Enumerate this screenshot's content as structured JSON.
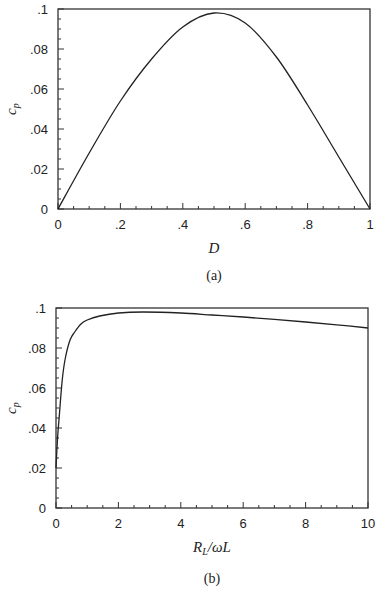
{
  "chart_data": [
    {
      "type": "line",
      "panel": "(a)",
      "title": "",
      "xlabel": "D",
      "ylabel": "c_p",
      "xlim": [
        0,
        1
      ],
      "ylim": [
        0,
        0.1
      ],
      "x_tick_labels": [
        "0",
        ".2",
        ".4",
        ".6",
        ".8",
        "1"
      ],
      "y_tick_labels": [
        "0",
        ".02",
        ".04",
        ".06",
        ".08",
        ".1"
      ],
      "grid": false,
      "series": [
        {
          "name": "c_p vs D",
          "x": [
            0,
            0.1,
            0.2,
            0.3,
            0.4,
            0.5,
            0.6,
            0.7,
            0.8,
            0.9,
            1.0
          ],
          "y": [
            0,
            0.028,
            0.054,
            0.075,
            0.091,
            0.098,
            0.093,
            0.076,
            0.052,
            0.026,
            0
          ]
        }
      ]
    },
    {
      "type": "line",
      "panel": "(b)",
      "title": "",
      "xlabel": "R_L/ωL",
      "ylabel": "c_p",
      "xlim": [
        0,
        10
      ],
      "ylim": [
        0,
        0.1
      ],
      "x_tick_labels": [
        "0",
        "2",
        "4",
        "6",
        "8",
        "10"
      ],
      "y_tick_labels": [
        "0",
        ".02",
        ".04",
        ".06",
        ".08",
        ".1"
      ],
      "grid": false,
      "series": [
        {
          "name": "c_p vs R_L/ωL",
          "x": [
            0,
            0.05,
            0.1,
            0.2,
            0.3,
            0.45,
            0.6,
            0.8,
            1.0,
            1.4,
            2.0,
            2.8,
            4.0,
            5.0,
            6.0,
            7.0,
            8.0,
            9.0,
            10.0
          ],
          "y": [
            0.02,
            0.035,
            0.045,
            0.064,
            0.075,
            0.084,
            0.088,
            0.092,
            0.094,
            0.096,
            0.0975,
            0.098,
            0.0975,
            0.0965,
            0.0955,
            0.0943,
            0.093,
            0.0916,
            0.09
          ]
        }
      ]
    }
  ],
  "panels": {
    "a": {
      "caption": "(a)",
      "xlabel": "D",
      "ylabel": "c",
      "ylabel_sub": "p"
    },
    "b": {
      "caption": "(b)",
      "xlabel_main": "R",
      "xlabel_sub": "L",
      "xlabel_rest": "/ωL",
      "ylabel": "c",
      "ylabel_sub": "p"
    }
  }
}
